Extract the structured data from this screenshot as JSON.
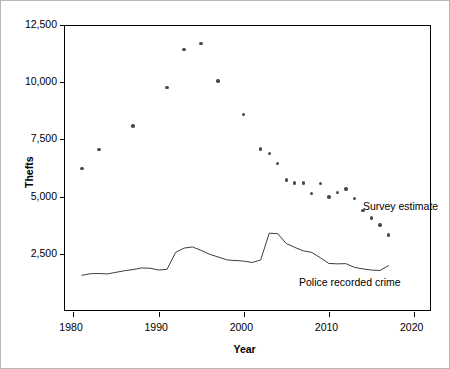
{
  "figure": {
    "background": "#ffffff",
    "border_color": "#b9b9b9",
    "plot_border_color": "#000000",
    "marker_color": "#4a4a55",
    "line_color": "#3d3d44"
  },
  "axes": {
    "ylabel": "Thefts",
    "xlabel": "Year",
    "yticks": [
      "2,500",
      "5,000",
      "7,500",
      "10,000",
      "12,500"
    ],
    "ytick_values": [
      2500,
      5000,
      7500,
      10000,
      12500
    ],
    "xticks": [
      "1980",
      "1990",
      "2000",
      "2010",
      "2020"
    ],
    "xtick_values": [
      1980,
      1990,
      2000,
      2010,
      2020
    ]
  },
  "labels": {
    "survey": "Survey estimate",
    "police": "Police recorded crime"
  },
  "chart_data": {
    "type": "scatter",
    "title": "",
    "xlabel": "Year",
    "ylabel": "Thefts",
    "xlim": [
      1978.9,
      2022.0
    ],
    "ylim": [
      0,
      12500
    ],
    "grid": false,
    "legend": "inline-annotations",
    "series": [
      {
        "name": "Survey estimate",
        "type": "scatter",
        "marker": "filled-circle",
        "points": [
          {
            "x": 1981,
            "y": 6220
          },
          {
            "x": 1983,
            "y": 7070
          },
          {
            "x": 1987,
            "y": 8080
          },
          {
            "x": 1991,
            "y": 9780
          },
          {
            "x": 1993,
            "y": 11430
          },
          {
            "x": 1995,
            "y": 11680
          },
          {
            "x": 1997,
            "y": 10050
          },
          {
            "x": 2000,
            "y": 8580
          },
          {
            "x": 2002,
            "y": 7080
          },
          {
            "x": 2003,
            "y": 6880
          },
          {
            "x": 2004,
            "y": 6450
          },
          {
            "x": 2005,
            "y": 5720
          },
          {
            "x": 2006,
            "y": 5600
          },
          {
            "x": 2007,
            "y": 5590
          },
          {
            "x": 2008,
            "y": 5130
          },
          {
            "x": 2009,
            "y": 5580
          },
          {
            "x": 2010,
            "y": 4990
          },
          {
            "x": 2011,
            "y": 5190
          },
          {
            "x": 2012,
            "y": 5330
          },
          {
            "x": 2013,
            "y": 4920
          },
          {
            "x": 2014,
            "y": 4400
          },
          {
            "x": 2015,
            "y": 4060
          },
          {
            "x": 2016,
            "y": 3760
          },
          {
            "x": 2017,
            "y": 3330
          }
        ]
      },
      {
        "name": "Police recorded crime",
        "type": "line",
        "segments": [
          {
            "label": "1981-1997",
            "points": [
              {
                "x": 1981,
                "y": 1560
              },
              {
                "x": 1982,
                "y": 1630
              },
              {
                "x": 1983,
                "y": 1640
              },
              {
                "x": 1984,
                "y": 1620
              },
              {
                "x": 1985,
                "y": 1690
              },
              {
                "x": 1986,
                "y": 1760
              },
              {
                "x": 1987,
                "y": 1810
              },
              {
                "x": 1988,
                "y": 1880
              },
              {
                "x": 1989,
                "y": 1870
              },
              {
                "x": 1990,
                "y": 1790
              },
              {
                "x": 1991,
                "y": 1820
              },
              {
                "x": 1992,
                "y": 2560
              },
              {
                "x": 1993,
                "y": 2750
              },
              {
                "x": 1994,
                "y": 2800
              },
              {
                "x": 1995,
                "y": 2650
              },
              {
                "x": 1996,
                "y": 2480
              },
              {
                "x": 1997,
                "y": 2360
              },
              {
                "x": 1998,
                "y": 2240
              },
              {
                "x": 1999,
                "y": 2200
              }
            ]
          },
          {
            "label": "1999-2017",
            "points": [
              {
                "x": 1999,
                "y": 2210
              },
              {
                "x": 2000,
                "y": 2180
              },
              {
                "x": 2001,
                "y": 2120
              },
              {
                "x": 2002,
                "y": 2230
              },
              {
                "x": 2003,
                "y": 3400
              },
              {
                "x": 2004,
                "y": 3380
              },
              {
                "x": 2005,
                "y": 2950
              },
              {
                "x": 2006,
                "y": 2780
              },
              {
                "x": 2007,
                "y": 2630
              },
              {
                "x": 2008,
                "y": 2560
              },
              {
                "x": 2009,
                "y": 2330
              },
              {
                "x": 2010,
                "y": 2080
              },
              {
                "x": 2011,
                "y": 2060
              },
              {
                "x": 2012,
                "y": 2070
              },
              {
                "x": 2013,
                "y": 1910
              },
              {
                "x": 2014,
                "y": 1840
              },
              {
                "x": 2015,
                "y": 1790
              },
              {
                "x": 2016,
                "y": 1770
              },
              {
                "x": 2017,
                "y": 1980
              }
            ]
          }
        ]
      }
    ],
    "annotations": [
      {
        "text": "Survey estimate",
        "x": 2014.0,
        "y": 4600
      },
      {
        "text": "Police recorded crime",
        "x": 2006.5,
        "y": 1280
      }
    ]
  }
}
